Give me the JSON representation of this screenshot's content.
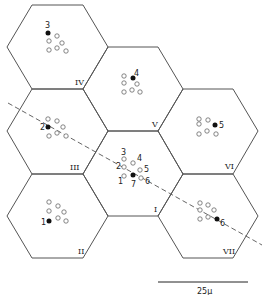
{
  "diagram": {
    "type": "hexagonal-cell-map",
    "colors": {
      "line": "#555555",
      "filled_dot": "#111111",
      "open_dot": "#666666",
      "background": "#ffffff"
    },
    "cells": [
      {
        "id": "IV",
        "label": "IV",
        "marker": "3"
      },
      {
        "id": "V",
        "label": "V",
        "marker": "4"
      },
      {
        "id": "III",
        "label": "III",
        "marker": "2"
      },
      {
        "id": "VI",
        "label": "VI",
        "marker": "5"
      },
      {
        "id": "I",
        "label": "I",
        "marker": "7"
      },
      {
        "id": "II",
        "label": "II",
        "marker": "1"
      },
      {
        "id": "VII",
        "label": "VII",
        "marker": "6"
      }
    ],
    "center_cluster_labels": [
      "1",
      "2",
      "3",
      "4",
      "5",
      "6",
      "7"
    ],
    "scale_bar": {
      "label": "25μ"
    },
    "axis_line": "dashed diagonal through cells III, I, VII"
  }
}
